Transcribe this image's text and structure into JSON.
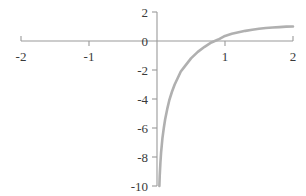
{
  "chart_data": {
    "type": "line",
    "title": "",
    "subtitle": "",
    "xlabel": "",
    "ylabel": "",
    "xlim": [
      -2,
      2
    ],
    "ylim": [
      -10,
      2
    ],
    "grid": false,
    "legend": null,
    "axis_color": "#9a9a9a",
    "curve_color": "#b0b0b0",
    "label_color": "#3a3a3a",
    "background": "#ffffff",
    "x_ticks": [
      -2,
      -1,
      1,
      2
    ],
    "x_tick_labels": [
      "-2",
      "-1",
      "1",
      "2"
    ],
    "y_ticks": [
      2,
      0,
      -2,
      -4,
      -6,
      -8,
      -10
    ],
    "y_tick_labels": [
      "2",
      "0",
      "-2",
      "-4",
      "-6",
      "-8",
      "-10"
    ],
    "series": [
      {
        "name": "log curve",
        "x": [
          0.035,
          0.04,
          0.05,
          0.06,
          0.07,
          0.08,
          0.1,
          0.12,
          0.15,
          0.18,
          0.22,
          0.26,
          0.3,
          0.35,
          0.4,
          0.5,
          0.6,
          0.7,
          0.8,
          0.9,
          1.0,
          1.1,
          1.2,
          1.3,
          1.4,
          1.5,
          1.6,
          1.7,
          1.8,
          1.9,
          2.0
        ],
        "y": [
          -10.0,
          -9.3,
          -8.4,
          -7.7,
          -7.2,
          -6.7,
          -6.0,
          -5.4,
          -4.7,
          -4.1,
          -3.5,
          -3.0,
          -2.6,
          -2.1,
          -1.8,
          -1.2,
          -0.75,
          -0.4,
          -0.1,
          0.1,
          0.35,
          0.5,
          0.6,
          0.7,
          0.78,
          0.85,
          0.9,
          0.93,
          0.96,
          0.99,
          1.0
        ]
      }
    ]
  },
  "axes": {
    "x_axis_name": "horizontal-axis",
    "y_axis_name": "vertical-axis"
  }
}
